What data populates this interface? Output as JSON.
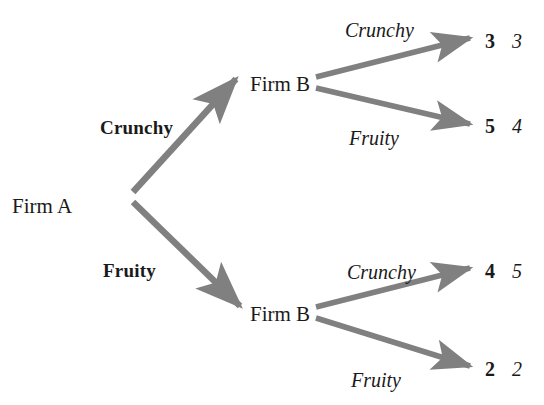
{
  "diagram": {
    "type": "extensive-form-game-tree",
    "title": "",
    "colors": {
      "branch": "#808080",
      "text": "#1a1a1a",
      "background": "#ffffff"
    },
    "nodes": [
      {
        "id": "root",
        "label": "Firm A",
        "x": 12,
        "y": 207,
        "player": "Firm A"
      },
      {
        "id": "b-top",
        "label": "Firm B",
        "x": 250,
        "y": 85,
        "player": "Firm B"
      },
      {
        "id": "b-bottom",
        "label": "Firm B",
        "x": 250,
        "y": 315,
        "player": "Firm B"
      }
    ],
    "first_stage_actions": [
      {
        "id": "a-crunchy",
        "label": "Crunchy",
        "x": 100,
        "y": 132
      },
      {
        "id": "a-fruity",
        "label": "Fruity",
        "x": 103,
        "y": 275
      }
    ],
    "second_stage_actions": [
      {
        "id": "b-top-crunchy",
        "label": "Crunchy",
        "x": 345,
        "y": 35
      },
      {
        "id": "b-top-fruity",
        "label": "Fruity",
        "x": 349,
        "y": 143
      },
      {
        "id": "b-bottom-crunchy",
        "label": "Crunchy",
        "x": 347,
        "y": 277
      },
      {
        "id": "b-bottom-fruity",
        "label": "Fruity",
        "x": 351,
        "y": 385
      }
    ],
    "outcomes": [
      {
        "id": "outcome-cc",
        "path": "Crunchy / Crunchy",
        "payoff_a": "3",
        "payoff_b": "3",
        "x_a": 485,
        "x_b": 512,
        "y": 46
      },
      {
        "id": "outcome-cf",
        "path": "Crunchy / Fruity",
        "payoff_a": "5",
        "payoff_b": "4",
        "x_a": 485,
        "x_b": 512,
        "y": 131
      },
      {
        "id": "outcome-fc",
        "path": "Fruity / Crunchy",
        "payoff_a": "4",
        "payoff_b": "5",
        "x_a": 485,
        "x_b": 512,
        "y": 276
      },
      {
        "id": "outcome-ff",
        "path": "Fruity / Fruity",
        "payoff_a": "2",
        "payoff_b": "2",
        "x_a": 485,
        "x_b": 512,
        "y": 374
      }
    ]
  }
}
